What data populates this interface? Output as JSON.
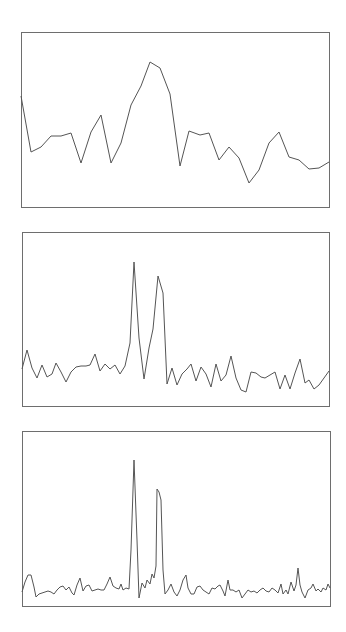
{
  "colors": {
    "frame": "#6e6e6e",
    "trace": "#555555",
    "background": "#ffffff"
  },
  "chart_data": [
    {
      "type": "line",
      "title": "",
      "xlabel": "",
      "ylabel": "",
      "grid": false,
      "legend": null,
      "frame": {
        "x": 21,
        "y": 32,
        "width": 308,
        "height": 175
      },
      "points": [
        [
          21,
          96
        ],
        [
          31,
          152
        ],
        [
          41,
          147
        ],
        [
          51,
          136
        ],
        [
          61,
          136
        ],
        [
          71,
          133
        ],
        [
          81,
          163
        ],
        [
          91,
          132
        ],
        [
          101,
          115
        ],
        [
          111,
          163
        ],
        [
          121,
          143
        ],
        [
          131,
          105
        ],
        [
          141,
          86
        ],
        [
          150,
          62
        ],
        [
          160,
          68
        ],
        [
          170,
          94
        ],
        [
          180,
          166
        ],
        [
          189,
          131
        ],
        [
          200,
          135
        ],
        [
          209,
          133
        ],
        [
          219,
          160
        ],
        [
          229,
          147
        ],
        [
          239,
          158
        ],
        [
          249,
          183
        ],
        [
          259,
          170
        ],
        [
          269,
          143
        ],
        [
          279,
          132
        ],
        [
          289,
          157
        ],
        [
          299,
          160
        ],
        [
          309,
          169
        ],
        [
          319,
          168
        ],
        [
          329,
          162
        ]
      ]
    },
    {
      "type": "line",
      "title": "",
      "xlabel": "",
      "ylabel": "",
      "grid": false,
      "legend": null,
      "frame": {
        "x": 22,
        "y": 232,
        "width": 307,
        "height": 174
      },
      "points": [
        [
          22,
          369
        ],
        [
          27,
          350
        ],
        [
          32,
          368
        ],
        [
          37,
          378
        ],
        [
          42,
          365
        ],
        [
          47,
          377
        ],
        [
          52,
          374
        ],
        [
          56,
          363
        ],
        [
          61,
          372
        ],
        [
          66,
          382
        ],
        [
          71,
          372
        ],
        [
          76,
          367
        ],
        [
          81,
          366
        ],
        [
          86,
          366
        ],
        [
          90,
          365
        ],
        [
          95,
          354
        ],
        [
          100,
          371
        ],
        [
          105,
          364
        ],
        [
          110,
          369
        ],
        [
          115,
          365
        ],
        [
          120,
          374
        ],
        [
          125,
          366
        ],
        [
          130,
          343
        ],
        [
          134,
          262
        ],
        [
          139,
          338
        ],
        [
          144,
          379
        ],
        [
          149,
          348
        ],
        [
          153,
          329
        ],
        [
          158,
          276
        ],
        [
          163,
          293
        ],
        [
          167,
          384
        ],
        [
          172,
          368
        ],
        [
          177,
          385
        ],
        [
          182,
          374
        ],
        [
          187,
          369
        ],
        [
          191,
          364
        ],
        [
          196,
          381
        ],
        [
          201,
          367
        ],
        [
          206,
          374
        ],
        [
          211,
          387
        ],
        [
          216,
          364
        ],
        [
          221,
          381
        ],
        [
          226,
          375
        ],
        [
          231,
          356
        ],
        [
          236,
          378
        ],
        [
          241,
          390
        ],
        [
          246,
          392
        ],
        [
          251,
          372
        ],
        [
          256,
          373
        ],
        [
          261,
          377
        ],
        [
          265,
          378
        ],
        [
          270,
          375
        ],
        [
          275,
          372
        ],
        [
          280,
          389
        ],
        [
          285,
          375
        ],
        [
          290,
          389
        ],
        [
          295,
          373
        ],
        [
          300,
          359
        ],
        [
          305,
          383
        ],
        [
          309,
          380
        ],
        [
          314,
          389
        ],
        [
          319,
          385
        ],
        [
          324,
          378
        ],
        [
          329,
          371
        ]
      ]
    },
    {
      "type": "line",
      "title": "",
      "xlabel": "",
      "ylabel": "",
      "grid": false,
      "legend": null,
      "frame": {
        "x": 22,
        "y": 431,
        "width": 308,
        "height": 175
      },
      "points": [
        [
          22,
          592
        ],
        [
          25,
          582
        ],
        [
          28,
          575
        ],
        [
          31,
          575
        ],
        [
          34,
          587
        ],
        [
          36,
          597
        ],
        [
          39,
          594
        ],
        [
          42,
          593
        ],
        [
          45,
          592
        ],
        [
          48,
          591
        ],
        [
          51,
          592
        ],
        [
          54,
          594
        ],
        [
          57,
          590
        ],
        [
          60,
          587
        ],
        [
          63,
          586
        ],
        [
          66,
          590
        ],
        [
          69,
          587
        ],
        [
          72,
          593
        ],
        [
          74,
          595
        ],
        [
          77,
          585
        ],
        [
          80,
          578
        ],
        [
          83,
          591
        ],
        [
          86,
          586
        ],
        [
          89,
          585
        ],
        [
          92,
          591
        ],
        [
          95,
          590
        ],
        [
          98,
          589
        ],
        [
          101,
          590
        ],
        [
          104,
          590
        ],
        [
          107,
          584
        ],
        [
          110,
          577
        ],
        [
          113,
          586
        ],
        [
          116,
          588
        ],
        [
          119,
          589
        ],
        [
          121,
          584
        ],
        [
          123,
          590
        ],
        [
          126,
          588
        ],
        [
          129,
          589
        ],
        [
          131,
          550
        ],
        [
          134,
          460
        ],
        [
          137,
          540
        ],
        [
          139,
          598
        ],
        [
          142,
          583
        ],
        [
          145,
          588
        ],
        [
          147,
          580
        ],
        [
          150,
          584
        ],
        [
          152,
          574
        ],
        [
          154,
          578
        ],
        [
          156,
          566
        ],
        [
          157,
          489
        ],
        [
          159,
          492
        ],
        [
          161,
          500
        ],
        [
          163,
          570
        ],
        [
          165,
          594
        ],
        [
          168,
          590
        ],
        [
          171,
          584
        ],
        [
          174,
          592
        ],
        [
          177,
          596
        ],
        [
          180,
          590
        ],
        [
          183,
          580
        ],
        [
          186,
          575
        ],
        [
          188,
          588
        ],
        [
          191,
          594
        ],
        [
          194,
          594
        ],
        [
          197,
          587
        ],
        [
          200,
          586
        ],
        [
          203,
          590
        ],
        [
          206,
          592
        ],
        [
          209,
          594
        ],
        [
          212,
          588
        ],
        [
          215,
          589
        ],
        [
          218,
          586
        ],
        [
          220,
          585
        ],
        [
          223,
          591
        ],
        [
          225,
          596
        ],
        [
          228,
          580
        ],
        [
          230,
          590
        ],
        [
          233,
          590
        ],
        [
          236,
          592
        ],
        [
          239,
          590
        ],
        [
          242,
          598
        ],
        [
          245,
          594
        ],
        [
          248,
          590
        ],
        [
          251,
          592
        ],
        [
          254,
          591
        ],
        [
          257,
          593
        ],
        [
          260,
          590
        ],
        [
          263,
          588
        ],
        [
          266,
          591
        ],
        [
          269,
          592
        ],
        [
          272,
          588
        ],
        [
          275,
          590
        ],
        [
          278,
          593
        ],
        [
          281,
          584
        ],
        [
          283,
          594
        ],
        [
          286,
          590
        ],
        [
          288,
          594
        ],
        [
          291,
          582
        ],
        [
          294,
          591
        ],
        [
          296,
          585
        ],
        [
          298,
          568
        ],
        [
          300,
          585
        ],
        [
          302,
          592
        ],
        [
          305,
          598
        ],
        [
          308,
          590
        ],
        [
          311,
          588
        ],
        [
          313,
          584
        ],
        [
          316,
          591
        ],
        [
          318,
          589
        ],
        [
          321,
          592
        ],
        [
          323,
          588
        ],
        [
          326,
          590
        ],
        [
          328,
          584
        ],
        [
          330,
          588
        ]
      ]
    }
  ]
}
